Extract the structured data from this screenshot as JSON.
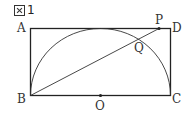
{
  "figure": {
    "title_number": "1",
    "title_icon": "figure-icon"
  },
  "points": {
    "A": "A",
    "B": "B",
    "C": "C",
    "D": "D",
    "O": "O",
    "P": "P",
    "Q": "Q"
  },
  "colors": {
    "stroke": "#222222",
    "label": "#333333",
    "background": "#ffffff"
  }
}
